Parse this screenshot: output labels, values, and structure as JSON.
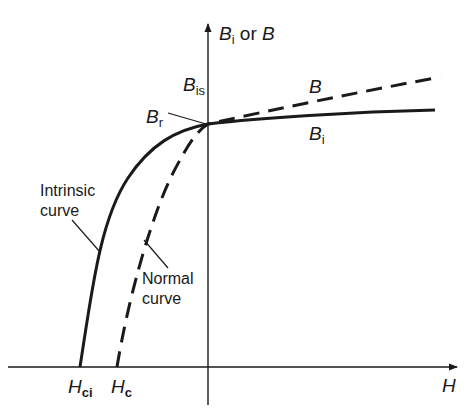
{
  "diagram": {
    "type": "magnetic hysteresis demagnetization curves",
    "axes": {
      "y_label_main": "B",
      "y_label_sub": "i",
      "y_label_or": " or ",
      "y_label_b": "B",
      "x_label": "H"
    },
    "labels": {
      "bis_main": "B",
      "bis_sub": "is",
      "br_main": "B",
      "br_sub": "r",
      "b_curve": "B",
      "bi_main": "B",
      "bi_sub": "i",
      "hci_main": "H",
      "hci_sub": "ci",
      "hc_main": "H",
      "hc_sub": "c"
    },
    "callouts": {
      "intrinsic_line1": "Intrinsic",
      "intrinsic_line2": "curve",
      "normal_line1": "Normal",
      "normal_line2": "curve"
    },
    "curves": [
      {
        "name": "Intrinsic curve",
        "style": "solid",
        "label": "Bi"
      },
      {
        "name": "Normal curve",
        "style": "dashed",
        "label": "B"
      }
    ],
    "colors": {
      "ink": "#1a1a1a",
      "background": "#ffffff"
    }
  }
}
